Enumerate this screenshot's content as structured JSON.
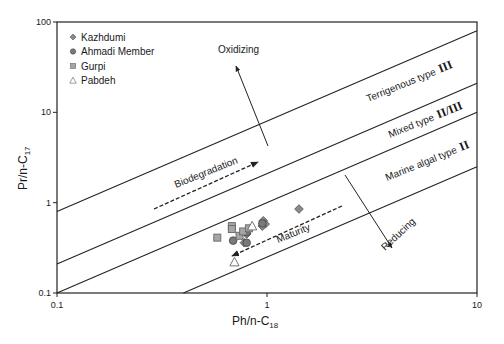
{
  "chart_data": {
    "type": "scatter",
    "title": "",
    "xlabel": "Ph/n-C",
    "xlabel_sub": "18",
    "ylabel": "Pr/n-C",
    "ylabel_sub": "17",
    "xscale": "log",
    "yscale": "log",
    "xlim": [
      0.1,
      10
    ],
    "ylim": [
      0.1,
      100
    ],
    "x_ticks": [
      {
        "v": 0.1,
        "label": "0.1"
      },
      {
        "v": 1,
        "label": "1"
      },
      {
        "v": 10,
        "label": "10"
      }
    ],
    "y_ticks": [
      {
        "v": 0.1,
        "label": "0.1"
      },
      {
        "v": 1,
        "label": "1"
      },
      {
        "v": 10,
        "label": "10"
      },
      {
        "v": 100,
        "label": "100"
      }
    ],
    "grid": false,
    "legend_position": "upper-left",
    "legend": [
      {
        "name": "Kazhdumi",
        "marker": "diamond"
      },
      {
        "name": "Ahmadi Member",
        "marker": "circle"
      },
      {
        "name": "Gurpi",
        "marker": "square"
      },
      {
        "name": "Pabdeh",
        "marker": "triangle"
      }
    ],
    "series": [
      {
        "name": "Kazhdumi",
        "marker": "diamond",
        "points": [
          [
            0.78,
            0.36
          ],
          [
            0.96,
            0.63
          ],
          [
            0.98,
            0.58
          ],
          [
            0.95,
            0.55
          ],
          [
            1.42,
            0.85
          ],
          [
            0.8,
            0.45
          ]
        ]
      },
      {
        "name": "Ahmadi Member",
        "marker": "circle",
        "points": [
          [
            0.69,
            0.38
          ],
          [
            0.8,
            0.47
          ],
          [
            0.8,
            0.36
          ],
          [
            0.95,
            0.59
          ]
        ]
      },
      {
        "name": "Gurpi",
        "marker": "square",
        "points": [
          [
            0.58,
            0.41
          ],
          [
            0.68,
            0.55
          ],
          [
            0.68,
            0.51
          ],
          [
            0.74,
            0.43
          ],
          [
            0.77,
            0.48
          ],
          [
            0.82,
            0.52
          ]
        ]
      },
      {
        "name": "Pabdeh",
        "marker": "triangle",
        "points": [
          [
            0.85,
            0.55
          ],
          [
            0.7,
            0.22
          ]
        ]
      }
    ],
    "boundary_lines": [
      {
        "name": "line-8x",
        "ratio": 8.0
      },
      {
        "name": "line-2x",
        "ratio": 2.1
      },
      {
        "name": "line-1x",
        "ratio": 1.0
      },
      {
        "name": "line-0.25x",
        "ratio": 0.25
      }
    ],
    "annotations": {
      "oxidizing": "Oxidizing",
      "reducing": "Reducing",
      "biodegradation": "Biodegradation",
      "maturity": "Maturity",
      "terrigenous": "Terrigenous type",
      "terrigenous_roman": "III",
      "mixed": "Mixed type",
      "mixed_roman": "II/III",
      "marine": "Marine algal type",
      "marine_roman": "II"
    }
  }
}
